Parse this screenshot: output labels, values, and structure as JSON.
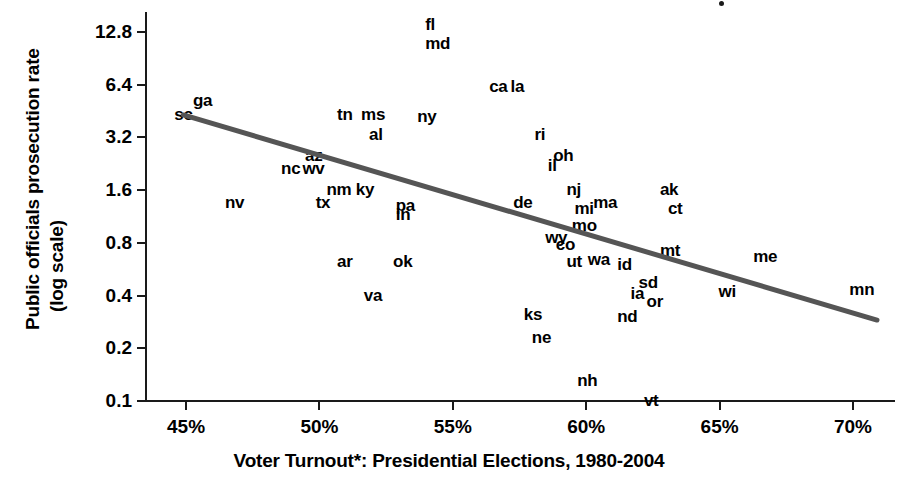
{
  "chart_data": {
    "type": "scatter",
    "title": "",
    "xlabel": "Voter Turnout*: Presidential Elections, 1980-2004",
    "ylabel": "Public officials prosecution rate (log scale)",
    "ylabel_line1": "Public officials prosecution rate",
    "ylabel_line2": "(log scale)",
    "yscale": "log",
    "xlim": [
      43.5,
      71.5
    ],
    "ylim": [
      0.1,
      16.0
    ],
    "grid": false,
    "legend": null,
    "xticks": [
      "45%",
      "50%",
      "55%",
      "60%",
      "65%",
      "70%"
    ],
    "xtick_values": [
      45,
      50,
      55,
      60,
      65,
      70
    ],
    "yticks": [
      "12.8",
      "6.4",
      "3.2",
      "1.6",
      "0.8",
      "0.4",
      "0.2",
      "0.1"
    ],
    "ytick_values": [
      12.8,
      6.4,
      3.2,
      1.6,
      0.8,
      0.4,
      0.2,
      0.1
    ],
    "point_label_kind": "state-abbreviation",
    "points": [
      {
        "label": "sc",
        "x": 44.9,
        "y": 4.3
      },
      {
        "label": "ga",
        "x": 45.6,
        "y": 5.2
      },
      {
        "label": "fl",
        "x": 54.3,
        "y": 14.0
      },
      {
        "label": "md",
        "x": 54.3,
        "y": 11.0
      },
      {
        "label": "ca",
        "x": 56.7,
        "y": 6.2
      },
      {
        "label": "la",
        "x": 57.5,
        "y": 6.2
      },
      {
        "label": "ny",
        "x": 54.0,
        "y": 4.2
      },
      {
        "label": "tn",
        "x": 51.0,
        "y": 4.3
      },
      {
        "label": "ms",
        "x": 51.9,
        "y": 4.3
      },
      {
        "label": "al",
        "x": 52.2,
        "y": 3.3
      },
      {
        "label": "ri",
        "x": 58.4,
        "y": 3.3
      },
      {
        "label": "oh",
        "x": 59.1,
        "y": 2.5
      },
      {
        "label": "il",
        "x": 58.9,
        "y": 2.2
      },
      {
        "label": "az",
        "x": 49.8,
        "y": 2.5
      },
      {
        "label": "nc",
        "x": 48.9,
        "y": 2.1
      },
      {
        "label": "wv",
        "x": 49.7,
        "y": 2.1
      },
      {
        "label": "nm",
        "x": 50.6,
        "y": 1.6
      },
      {
        "label": "ky",
        "x": 51.7,
        "y": 1.6
      },
      {
        "label": "nj",
        "x": 59.6,
        "y": 1.6
      },
      {
        "label": "mi",
        "x": 59.9,
        "y": 1.25
      },
      {
        "label": "ma",
        "x": 60.6,
        "y": 1.35
      },
      {
        "label": "ak",
        "x": 63.1,
        "y": 1.6
      },
      {
        "label": "ct",
        "x": 63.4,
        "y": 1.25
      },
      {
        "label": "de",
        "x": 57.6,
        "y": 1.35
      },
      {
        "label": "nv",
        "x": 46.8,
        "y": 1.35
      },
      {
        "label": "tx",
        "x": 50.2,
        "y": 1.35
      },
      {
        "label": "pa",
        "x": 53.2,
        "y": 1.3
      },
      {
        "label": "in",
        "x": 53.2,
        "y": 1.15
      },
      {
        "label": "mo",
        "x": 59.8,
        "y": 1.0
      },
      {
        "label": "wy",
        "x": 58.8,
        "y": 0.85
      },
      {
        "label": "co",
        "x": 59.2,
        "y": 0.78
      },
      {
        "label": "ut",
        "x": 59.6,
        "y": 0.62
      },
      {
        "label": "wa",
        "x": 60.4,
        "y": 0.64
      },
      {
        "label": "id",
        "x": 61.5,
        "y": 0.6
      },
      {
        "label": "mt",
        "x": 63.1,
        "y": 0.72
      },
      {
        "label": "me",
        "x": 66.6,
        "y": 0.66
      },
      {
        "label": "ar",
        "x": 51.0,
        "y": 0.62
      },
      {
        "label": "ok",
        "x": 53.1,
        "y": 0.62
      },
      {
        "label": "sd",
        "x": 62.3,
        "y": 0.47
      },
      {
        "label": "ia",
        "x": 62.0,
        "y": 0.41
      },
      {
        "label": "or",
        "x": 62.6,
        "y": 0.37
      },
      {
        "label": "wi",
        "x": 65.3,
        "y": 0.42
      },
      {
        "label": "mn",
        "x": 70.2,
        "y": 0.43
      },
      {
        "label": "va",
        "x": 52.0,
        "y": 0.4
      },
      {
        "label": "ks",
        "x": 58.0,
        "y": 0.31
      },
      {
        "label": "nd",
        "x": 61.5,
        "y": 0.3
      },
      {
        "label": "ne",
        "x": 58.3,
        "y": 0.23
      },
      {
        "label": "nh",
        "x": 60.0,
        "y": 0.13
      },
      {
        "label": "vt",
        "x": 62.5,
        "y": 0.1
      }
    ],
    "trendline": {
      "type": "linear-fit-on-log-y",
      "start": {
        "x": 44.9,
        "y": 4.3
      },
      "end": {
        "x": 70.9,
        "y": 0.29
      },
      "color": "#555555"
    }
  },
  "axes": {
    "y_title_line1": "Public officials prosecution rate",
    "y_title_line2": "(log scale)",
    "x_title": "Voter Turnout*: Presidential Elections, 1980-2004"
  }
}
